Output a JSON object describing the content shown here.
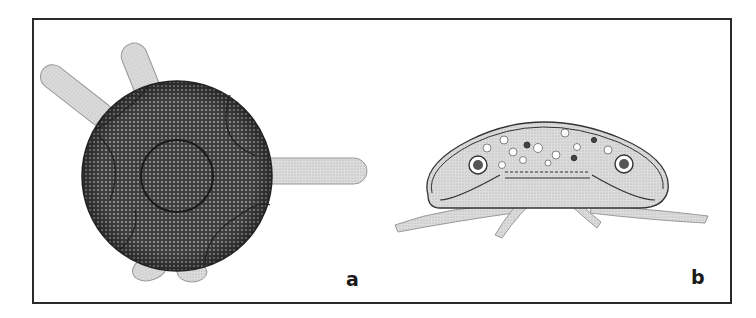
{
  "figure": {
    "panels": [
      {
        "label": "a",
        "description": "Spherical cell with dense hexagonal mesh surface, central circular nucleus outline, and finger-like pseudopodia projecting outward"
      },
      {
        "label": "b",
        "description": "Side-view cross-section of dome-shaped cell with peripheral vacuoles, two nuclei, internal granules, and radiating pseudopodia beneath"
      }
    ],
    "colors": {
      "frame": "#2a2a2a",
      "cell_dark": "#4a4a4a",
      "pseudopod": "#d6d6d6",
      "outline": "#333333"
    }
  }
}
